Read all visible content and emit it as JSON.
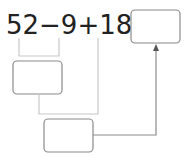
{
  "equation": {
    "terms": [
      "52",
      "−",
      "9",
      "+",
      "18",
      "="
    ],
    "text": "52−9+18="
  },
  "boxes": {
    "answer": {
      "value": ""
    },
    "step1": {
      "value": ""
    },
    "step2": {
      "value": ""
    }
  },
  "colors": {
    "text": "#222222",
    "box": "#8a8a8a",
    "line": "#a0a0a0",
    "bracket": "#c8c8c8"
  }
}
